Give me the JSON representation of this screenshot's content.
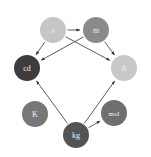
{
  "figure": {
    "background_color": "#ffffff",
    "width": 151,
    "height": 157,
    "caption_text": ""
  },
  "chart_data": {
    "type": "diagram",
    "diagram_kind": "directed-graph",
    "title": "",
    "xlabel": "",
    "ylabel": "",
    "grid": false,
    "legend": "none",
    "nodes": [
      {
        "id": "s",
        "label": "s",
        "x": 53,
        "y": 30,
        "r": 13,
        "fill": "#c6c6c6",
        "text_color": "#f2f2f2",
        "font_size": 8
      },
      {
        "id": "m",
        "label": "m",
        "x": 96,
        "y": 30,
        "r": 13,
        "fill": "#8a8a8a",
        "text_color": "#efefef",
        "font_size": 8
      },
      {
        "id": "cd",
        "label": "cd",
        "x": 27,
        "y": 68,
        "r": 13,
        "fill": "#3d3d3d",
        "text_color": "#f0f0f0",
        "font_size": 8
      },
      {
        "id": "A",
        "label": "A",
        "x": 124,
        "y": 68,
        "r": 13,
        "fill": "#c9c9c9",
        "text_color": "#f4f4f4",
        "font_size": 8
      },
      {
        "id": "K",
        "label": "K",
        "x": 35,
        "y": 114,
        "r": 13,
        "fill": "#777777",
        "text_color": "#f2f2f2",
        "font_size": 8
      },
      {
        "id": "kg",
        "label": "kg",
        "x": 76,
        "y": 135,
        "r": 13,
        "fill": "#545454",
        "text_color": "#f0f0f0",
        "font_size": 8
      },
      {
        "id": "mol",
        "label": "mol",
        "x": 114,
        "y": 113,
        "r": 13,
        "fill": "#6f6f6f",
        "text_color": "#f2f2f2",
        "font_size": 7
      }
    ],
    "edges": [
      {
        "from": "s",
        "to": "m",
        "directed": true
      },
      {
        "from": "s",
        "to": "cd",
        "directed": true
      },
      {
        "from": "s",
        "to": "A",
        "directed": true
      },
      {
        "from": "m",
        "to": "cd",
        "directed": true
      },
      {
        "from": "m",
        "to": "A",
        "directed": true
      },
      {
        "from": "kg",
        "to": "cd",
        "directed": true
      },
      {
        "from": "kg",
        "to": "A",
        "directed": true
      },
      {
        "from": "kg",
        "to": "mol",
        "directed": true
      }
    ],
    "edge_color": "#4a4a4a",
    "arrow_color": "#333333"
  }
}
